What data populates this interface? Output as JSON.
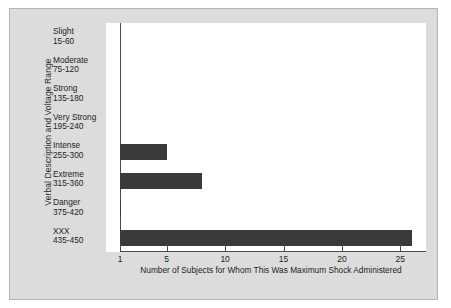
{
  "chart_data": {
    "type": "bar",
    "orientation": "horizontal",
    "title": "",
    "xlabel": "Number of Subjects for Whom This Was Maximum Shock Administered",
    "ylabel": "Verbal Description and Voltage Range",
    "xlim": [
      1,
      26
    ],
    "xticks": [
      1,
      5,
      10,
      15,
      20,
      25
    ],
    "xtick_labels": [
      "1",
      "5",
      "10",
      "15",
      "20",
      "25"
    ],
    "grid": false,
    "legend": "none",
    "bar_color": "#3a3a3a",
    "categories": [
      "Slight\n15-60",
      "Moderate\n75-120",
      "Strong\n135-180",
      "Very Strong\n195-240",
      "Intense\n255-300",
      "Extreme\n315-360",
      "Danger\n375-420",
      "XXX\n435-450"
    ],
    "category_names": [
      "Slight",
      "Moderate",
      "Strong",
      "Very Strong",
      "Intense",
      "Extreme",
      "Danger",
      "XXX"
    ],
    "category_ranges": [
      "15-60",
      "75-120",
      "135-180",
      "195-240",
      "255-300",
      "315-360",
      "375-420",
      "435-450"
    ],
    "values": [
      0,
      0,
      0,
      0,
      5,
      8,
      1,
      26
    ]
  },
  "axis": {
    "y_title": "Verbal Description and Voltage Range",
    "x_caption": "Number of Subjects for Whom This Was Maximum Shock Administered"
  },
  "categories": [
    {
      "name": "Slight",
      "range": "15-60",
      "value": 0
    },
    {
      "name": "Moderate",
      "range": "75-120",
      "value": 0
    },
    {
      "name": "Strong",
      "range": "135-180",
      "value": 0
    },
    {
      "name": "Very Strong",
      "range": "195-240",
      "value": 0
    },
    {
      "name": "Intense",
      "range": "255-300",
      "value": 5
    },
    {
      "name": "Extreme",
      "range": "315-360",
      "value": 8
    },
    {
      "name": "Danger",
      "range": "375-420",
      "value": 1
    },
    {
      "name": "XXX",
      "range": "435-450",
      "value": 26
    }
  ],
  "xticks": [
    {
      "value": 1,
      "label": "1"
    },
    {
      "value": 5,
      "label": "5"
    },
    {
      "value": 10,
      "label": "10"
    },
    {
      "value": 15,
      "label": "15"
    },
    {
      "value": 20,
      "label": "20"
    },
    {
      "value": 25,
      "label": "25"
    }
  ],
  "colors": {
    "bar": "#3a3a3a",
    "panel": "#dcdcdc",
    "plot": "#ffffff",
    "axis": "#4a4a4a",
    "text": "#1d1d1d"
  }
}
